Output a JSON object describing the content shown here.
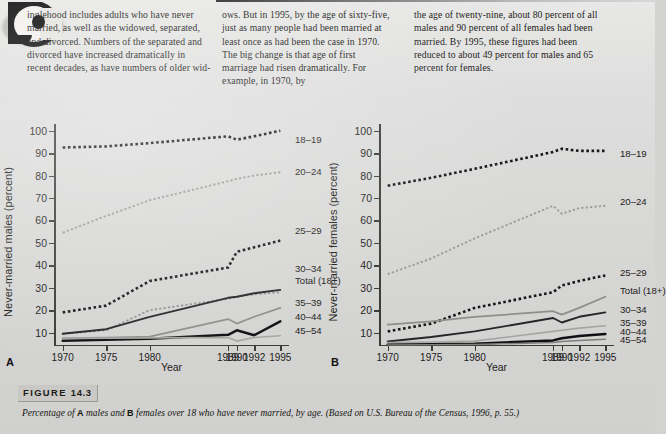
{
  "article": {
    "dropcap_letter": "S",
    "column1": "inglehood includes adults who have never married, as well as the widowed, separated, and divorced. Numbers of the separated and divorced have increased dramatically in recent decades, as have numbers of older wid-",
    "column2": "ows. But in 1995, by the age of sixty-five, just as many people had been married at least once as had been the case in 1970. The big change is that age of first marriage had risen dramatically. For example, in 1970, by",
    "column3": "the age of twenty-nine, about 80 percent of all males and 90 percent of all females had been married. By 1995, these figures had been reduced to about 49 percent for males and 65 percent for females."
  },
  "figure": {
    "tag_word": "FIGURE",
    "number": "14.3",
    "caption_part1": "Percentage of ",
    "caption_a": "A",
    "caption_part2": " males and ",
    "caption_b": "B",
    "caption_part3": " females over 18 who have never married, by age. (Based on U.S. Bureau of the Census, 1996, p. 55.)"
  },
  "chart_data": [
    {
      "panel": "A",
      "type": "line",
      "title": "",
      "xlabel": "Year",
      "ylabel": "Never-married males (percent)",
      "x": [
        1970,
        1975,
        1980,
        1989,
        1990,
        1992,
        1995
      ],
      "xticklabels": [
        "1970",
        "1975",
        "1980",
        "1989",
        "1990",
        "1992",
        "1995"
      ],
      "yticklabels": [
        "10",
        "20",
        "30",
        "40",
        "50",
        "60",
        "70",
        "80",
        "90",
        "100"
      ],
      "ylim": [
        4,
        103
      ],
      "xlim": [
        1969,
        1996
      ],
      "grid": false,
      "legend_position": "right-of-plot",
      "series": [
        {
          "name": "18-19",
          "label": "18–19",
          "style": "dotted-bold-black",
          "values": [
            92.5,
            93.0,
            94.5,
            97.5,
            96.0,
            97.5,
            100.0
          ]
        },
        {
          "name": "20-24",
          "label": "20–24",
          "style": "dotted-gray",
          "values": [
            54.5,
            62.0,
            69.0,
            77.5,
            78.5,
            80.0,
            81.5
          ]
        },
        {
          "name": "25-29",
          "label": "25–29",
          "style": "dotted-bold-black",
          "values": [
            19.0,
            22.0,
            33.0,
            39.0,
            46.0,
            48.0,
            51.0
          ]
        },
        {
          "name": "30-34",
          "label": "30–34",
          "style": "dotted-gray-thin",
          "values": [
            9.5,
            11.0,
            20.0,
            25.0,
            26.0,
            27.0,
            28.0
          ]
        },
        {
          "name": "Total (18+)",
          "label": "Total (18+)",
          "style": "solid-dark",
          "values": [
            9.5,
            11.5,
            17.0,
            25.5,
            26.0,
            27.5,
            29.0
          ]
        },
        {
          "name": "35-39",
          "label": "35–39",
          "style": "solid-gray",
          "values": [
            7.5,
            7.8,
            8.2,
            16.0,
            14.0,
            17.0,
            21.0
          ]
        },
        {
          "name": "40-44",
          "label": "40–44",
          "style": "solid-black-bold",
          "values": [
            6.3,
            6.8,
            7.2,
            9.0,
            11.0,
            8.8,
            15.0
          ]
        },
        {
          "name": "45-54",
          "label": "45–54",
          "style": "solid-lightgray",
          "values": [
            7.4,
            7.5,
            7.6,
            7.8,
            6.2,
            7.8,
            8.6
          ]
        }
      ]
    },
    {
      "panel": "B",
      "type": "line",
      "title": "",
      "xlabel": "Year",
      "ylabel": "Never-married females (percent)",
      "x": [
        1970,
        1975,
        1980,
        1989,
        1990,
        1992,
        1995
      ],
      "xticklabels": [
        "1970",
        "1975",
        "1980",
        "1989",
        "1990",
        "1992",
        "1995"
      ],
      "yticklabels": [
        "10",
        "20",
        "30",
        "40",
        "50",
        "60",
        "70",
        "80",
        "90",
        "100"
      ],
      "ylim": [
        4,
        103
      ],
      "xlim": [
        1969,
        1996
      ],
      "grid": false,
      "legend_position": "right-of-plot",
      "series": [
        {
          "name": "18-19",
          "label": "18–19",
          "style": "dotted-bold-black",
          "values": [
            75.5,
            79.0,
            83.0,
            90.5,
            92.0,
            91.0,
            91.0
          ]
        },
        {
          "name": "20-24",
          "label": "20–24",
          "style": "dotted-gray",
          "values": [
            36.0,
            43.0,
            52.0,
            66.5,
            63.0,
            65.5,
            66.5
          ]
        },
        {
          "name": "25-29",
          "label": "25–29",
          "style": "dotted-bold-black",
          "values": [
            10.5,
            14.0,
            21.0,
            28.0,
            31.0,
            33.0,
            35.5
          ]
        },
        {
          "name": "Total (18+)",
          "label": "Total (18+)",
          "style": "solid-gray",
          "values": [
            13.5,
            15.0,
            17.0,
            19.5,
            18.0,
            21.0,
            26.0
          ]
        },
        {
          "name": "30-34",
          "label": "30–34",
          "style": "solid-dark",
          "values": [
            6.0,
            8.0,
            10.5,
            16.5,
            14.5,
            17.0,
            19.0
          ]
        },
        {
          "name": "35-39",
          "label": "35–39",
          "style": "solid-lightgray",
          "values": [
            5.5,
            5.8,
            6.2,
            10.5,
            11.0,
            12.0,
            13.0
          ]
        },
        {
          "name": "40-44",
          "label": "40–44",
          "style": "solid-black-bold",
          "values": [
            4.6,
            4.8,
            5.0,
            6.5,
            7.5,
            8.5,
            9.3
          ]
        },
        {
          "name": "45-54",
          "label": "45–54",
          "style": "solid-gray-thin",
          "values": [
            4.5,
            4.6,
            4.7,
            5.5,
            6.0,
            6.5,
            7.0
          ]
        }
      ]
    }
  ]
}
